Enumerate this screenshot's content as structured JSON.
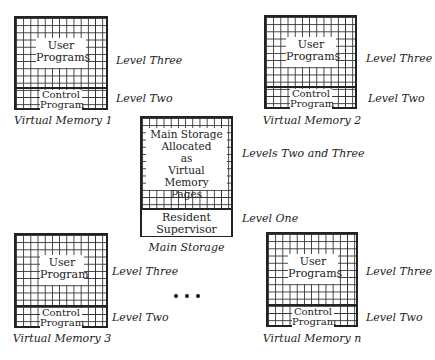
{
  "diagram": {
    "vm1": {
      "upper": "User\nPrograms",
      "upper_lines": [
        "User",
        "Programs"
      ],
      "lower_lines": [
        "Control",
        "Program"
      ],
      "caption": "Virtual Memory 1",
      "level_upper": "Level Three",
      "level_lower": "Level Two"
    },
    "vm2": {
      "upper_lines": [
        "User",
        "Programs"
      ],
      "lower_lines": [
        "Control",
        "Program"
      ],
      "caption": "Virtual Memory 2",
      "level_upper": "Level Three",
      "level_lower": "Level Two"
    },
    "vm3": {
      "upper_lines": [
        "User",
        "Program"
      ],
      "lower_lines": [
        "Control",
        "Program"
      ],
      "caption": "Virtual Memory 3",
      "level_upper": "Level Three",
      "level_lower": "Level Two"
    },
    "vmn": {
      "upper_lines": [
        "User",
        "Programs"
      ],
      "lower_lines": [
        "Control",
        "Program"
      ],
      "caption": "Virtual Memory n",
      "level_upper": "Level Three",
      "level_lower": "Level Two"
    },
    "main": {
      "upper_lines": [
        "Main Storage",
        "Allocated",
        "as",
        "Virtual Memory",
        "Pages"
      ],
      "lower_lines": [
        "Resident",
        "Supervisor"
      ],
      "caption": "Main Storage",
      "level_upper": "Levels Two and Three",
      "level_lower": "Level One"
    },
    "ellipsis": "..."
  }
}
